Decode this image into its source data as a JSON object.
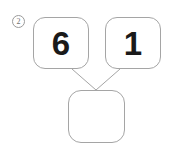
{
  "worksheet": {
    "problem_number": "2",
    "background_color": "#ffffff",
    "border_color": "#a5a5a5",
    "text_color": "#1a1a1a",
    "marker_color": "#6f6f6f"
  },
  "diagram": {
    "type": "number-bond",
    "parts": [
      {
        "id": "part-1",
        "value": "6",
        "filled": true
      },
      {
        "id": "part-2",
        "value": "1",
        "filled": true
      }
    ],
    "whole": {
      "id": "whole",
      "value": "",
      "filled": false
    },
    "connectors": [
      {
        "from": "part-1",
        "to": "whole"
      },
      {
        "from": "part-2",
        "to": "whole"
      }
    ]
  }
}
